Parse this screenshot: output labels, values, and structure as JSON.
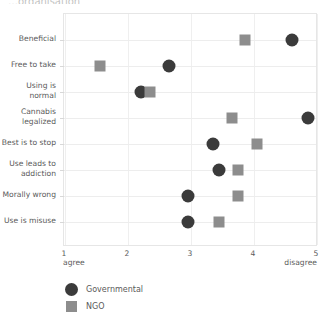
{
  "title": "…organisation",
  "chart_data": {
    "type": "scatter",
    "title": "…organisation",
    "xlabel": "",
    "ylabel": "",
    "xlim": [
      1,
      5
    ],
    "xticks": [
      1,
      2,
      3,
      4,
      5
    ],
    "xtick_labels": [
      "1",
      "2",
      "3",
      "4",
      "5"
    ],
    "x_axis_left_anchor": "agree",
    "x_axis_right_anchor": "disagree",
    "grid": true,
    "legend_position": "below-left",
    "categories": [
      "Beneficial",
      "Free to take",
      "Using is\nnormal",
      "Cannabis\nlegalized",
      "Best is to stop",
      "Use leads to\naddiction",
      "Morally wrong",
      "Use is misuse"
    ],
    "series": [
      {
        "name": "Governmental",
        "marker": "circle",
        "color": "#3b3b3b",
        "values": [
          4.6,
          2.65,
          2.2,
          4.85,
          3.35,
          3.45,
          2.95,
          2.95
        ]
      },
      {
        "name": "NGO",
        "marker": "square",
        "color": "#8d8d8d",
        "values": [
          3.85,
          1.55,
          2.35,
          3.65,
          4.05,
          3.75,
          3.75,
          3.45
        ]
      }
    ]
  },
  "legend": {
    "items": [
      {
        "label": "Governmental",
        "marker": "circle",
        "color": "#3b3b3b"
      },
      {
        "label": "NGO",
        "marker": "square",
        "color": "#8d8d8d"
      }
    ]
  },
  "colors": {
    "governmental": "#3b3b3b",
    "ngo": "#8d8d8d",
    "grid": "#efefef",
    "frame": "#e6e6e6",
    "text": "#5a5a5a",
    "background": "#ffffff"
  }
}
